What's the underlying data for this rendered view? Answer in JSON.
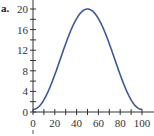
{
  "chart_data": {
    "type": "line",
    "panel_label": "a.",
    "title": "",
    "xlabel": "",
    "ylabel": "",
    "xlim": [
      0,
      100
    ],
    "ylim": [
      0,
      20
    ],
    "grid": false,
    "legend": null,
    "x_ticks": [
      0,
      20,
      40,
      60,
      80,
      100
    ],
    "x_minor_step": 10,
    "y_ticks": [
      0,
      4,
      8,
      12,
      16,
      20
    ],
    "y_minor_step": 2,
    "series": [
      {
        "name": "curve",
        "color": "#3b5a9a",
        "x": [
          0,
          5,
          10,
          15,
          20,
          25,
          30,
          35,
          40,
          45,
          50,
          55,
          60,
          65,
          70,
          75,
          80,
          85,
          90,
          95,
          100
        ],
        "values": [
          0.5,
          0.9,
          1.9,
          4.1,
          6.9,
          10.0,
          13.1,
          15.9,
          18.1,
          19.5,
          20.0,
          19.5,
          18.1,
          15.9,
          13.1,
          10.0,
          6.9,
          4.1,
          1.9,
          0.9,
          0.5
        ]
      }
    ]
  },
  "labels": {
    "panel": "a."
  }
}
